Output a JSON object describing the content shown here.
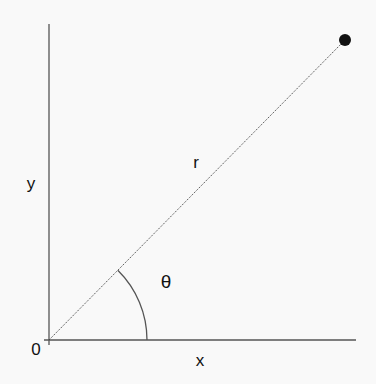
{
  "diagram": {
    "type": "polar-coordinates",
    "labels": {
      "y_axis": "y",
      "x_axis": "x",
      "origin": "0",
      "radius": "r",
      "angle": "θ"
    },
    "geometry": {
      "origin": [
        49,
        340
      ],
      "y_axis_top": [
        49,
        24
      ],
      "x_axis_end": [
        356,
        340
      ],
      "point": [
        345,
        40
      ],
      "point_radius": 6,
      "arc_radius": 98
    },
    "colors": {
      "axis": "#555555",
      "radius_line": "#444444",
      "point": "#111111",
      "text": "#111111"
    }
  }
}
